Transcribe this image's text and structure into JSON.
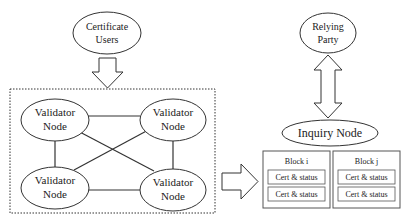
{
  "diagram": {
    "certificate_users": {
      "line1": "Certificate",
      "line2": "Users"
    },
    "validator_nodes": [
      {
        "line1": "Validator",
        "line2": "Node"
      },
      {
        "line1": "Validator",
        "line2": "Node"
      },
      {
        "line1": "Validator",
        "line2": "Node"
      },
      {
        "line1": "Validator",
        "line2": "Node"
      }
    ],
    "relying_party": {
      "line1": "Relying",
      "line2": "Party"
    },
    "inquiry_node": {
      "label": "Inquiry Node"
    },
    "blocks": [
      {
        "title": "Block i",
        "entries": [
          "Cert & status",
          "Cert & status"
        ]
      },
      {
        "title": "Block j",
        "entries": [
          "Cert & status",
          "Cert & status"
        ]
      }
    ],
    "colors": {
      "stroke": "#333333",
      "background": "#ffffff"
    }
  }
}
